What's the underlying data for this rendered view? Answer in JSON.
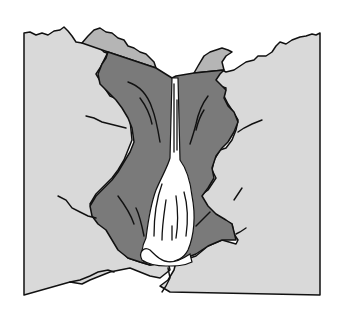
{
  "illustration": {
    "subject": "waterfall",
    "description": "Line illustration of a waterfall cascading down a dark rock gorge between light gray cliffs",
    "colors": {
      "background": "#ffffff",
      "cliff": "#d9d9d9",
      "far_ridge": "#b5b5b5",
      "gorge": "#7a7a7a",
      "water": "#ffffff",
      "outline": "#111111"
    }
  }
}
